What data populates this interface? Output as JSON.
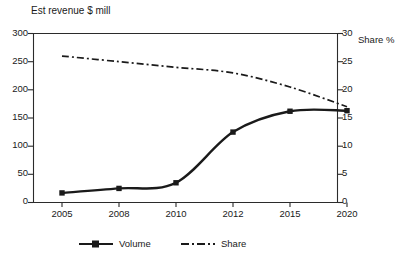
{
  "chart_data": {
    "type": "line",
    "title": "Est revenue $ mill",
    "xlabel": "",
    "ylabel": "Est revenue $ mill",
    "y2label": "Share %",
    "grid": false,
    "legend_position": "bottom",
    "categories": [
      "2005",
      "2008",
      "2010",
      "2012",
      "2015",
      "2020"
    ],
    "ylim": [
      0,
      300
    ],
    "yticks": [
      "0",
      "50",
      "100",
      "150",
      "200",
      "250",
      "300"
    ],
    "y2lim": [
      0,
      30
    ],
    "y2ticks": [
      "0",
      "5",
      "10",
      "15",
      "20",
      "25",
      "30"
    ],
    "series": [
      {
        "name": "Volume",
        "axis": "left",
        "style": "solid",
        "marker": "square",
        "values": [
          17,
          25,
          35,
          125,
          162,
          163
        ]
      },
      {
        "name": "Share",
        "axis": "right",
        "style": "dash-dot",
        "marker": "none",
        "values": [
          26,
          25,
          24,
          23,
          20.5,
          17
        ]
      }
    ]
  },
  "axes": {
    "title": "Est revenue $ mill",
    "right_label": "Share %",
    "left_ticks": [
      "300",
      "250",
      "200",
      "150",
      "100",
      "50",
      "0"
    ],
    "right_ticks": [
      "30",
      "25",
      "20",
      "15",
      "10",
      "5",
      "0"
    ],
    "x_ticks": [
      "2005",
      "2008",
      "2010",
      "2012",
      "2015",
      "2020"
    ]
  },
  "legend": {
    "volume_label": "Volume",
    "share_label": "Share"
  },
  "colors": {
    "ink": "#1a1a1a",
    "axis": "#2b2b2b",
    "background": "#ffffff"
  }
}
